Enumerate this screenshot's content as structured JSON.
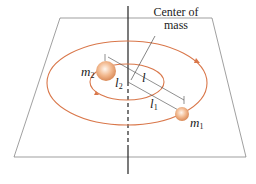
{
  "diagram": {
    "labels": {
      "center_of_mass_line1": "Center of",
      "center_of_mass_line2": "mass",
      "m2": "m",
      "m2_sub": "2",
      "m1": "m",
      "m1_sub": "1",
      "l": "l",
      "l1": "l",
      "l1_sub": "1",
      "l2": "l",
      "l2_sub": "2"
    },
    "colors": {
      "orbit": "#d9774a",
      "plane": "#555555",
      "axis": "#222222",
      "mass_fill": "#f2b98f",
      "mass_highlight": "#fff3e8",
      "text": "#222222"
    }
  }
}
